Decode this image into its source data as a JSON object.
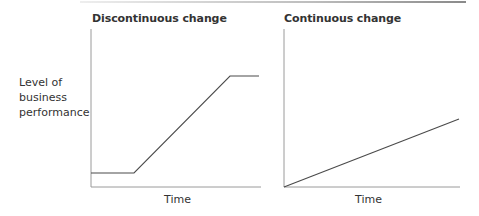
{
  "diagram": {
    "y_axis_label": [
      "Level of",
      "business",
      "performance"
    ],
    "panels": [
      {
        "title": "Discontinuous change",
        "x_axis_label": "Time",
        "line_points": [
          [
            91,
            173
          ],
          [
            134,
            173
          ],
          [
            230,
            76
          ],
          [
            259,
            76
          ]
        ]
      },
      {
        "title": "Continuous change",
        "x_axis_label": "Time",
        "line_points": [
          [
            284,
            187
          ],
          [
            459,
            119
          ]
        ]
      }
    ],
    "colors": {
      "axis": "#9a9a9a",
      "line": "#4a4a4a",
      "text": "#333333"
    }
  }
}
